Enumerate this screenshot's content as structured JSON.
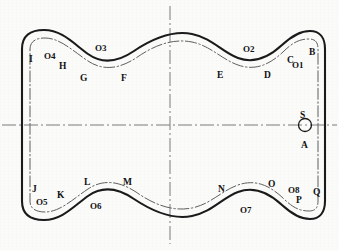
{
  "figure": {
    "origin_label": "(0,0)",
    "background_color": "#fbfbfa",
    "outline_color": "#1a1a1a",
    "offset_curve_color": "#6b6b6b",
    "centerline_color": "#7a7a7a"
  },
  "point_labels": [
    {
      "id": "I",
      "text": "I",
      "x": 29,
      "y": 55
    },
    {
      "id": "H",
      "text": "H",
      "x": 59,
      "y": 62
    },
    {
      "id": "G",
      "text": "G",
      "x": 80,
      "y": 74
    },
    {
      "id": "F",
      "text": "F",
      "x": 121,
      "y": 74
    },
    {
      "id": "E",
      "text": "E",
      "x": 217,
      "y": 71
    },
    {
      "id": "D",
      "text": "D",
      "x": 264,
      "y": 71
    },
    {
      "id": "C",
      "text": "C",
      "x": 287,
      "y": 56
    },
    {
      "id": "B",
      "text": "B",
      "x": 309,
      "y": 48
    },
    {
      "id": "S",
      "text": "S",
      "x": 300,
      "y": 111
    },
    {
      "id": "A",
      "text": "A",
      "x": 301,
      "y": 141
    },
    {
      "id": "Q",
      "text": "Q",
      "x": 313,
      "y": 188
    },
    {
      "id": "P",
      "text": "P",
      "x": 296,
      "y": 196
    },
    {
      "id": "O",
      "text": "O",
      "x": 268,
      "y": 180
    },
    {
      "id": "N",
      "text": "N",
      "x": 218,
      "y": 185
    },
    {
      "id": "M",
      "text": "M",
      "x": 123,
      "y": 178
    },
    {
      "id": "L",
      "text": "L",
      "x": 84,
      "y": 178
    },
    {
      "id": "K",
      "text": "K",
      "x": 57,
      "y": 191
    },
    {
      "id": "J",
      "text": "J",
      "x": 32,
      "y": 185
    }
  ],
  "arc_center_labels": [
    {
      "id": "O1",
      "text": "O1",
      "x": 292,
      "y": 61
    },
    {
      "id": "O2",
      "text": "O2",
      "x": 243,
      "y": 45
    },
    {
      "id": "O3",
      "text": "O3",
      "x": 95,
      "y": 44
    },
    {
      "id": "O4",
      "text": "O4",
      "x": 44,
      "y": 52
    },
    {
      "id": "O5",
      "text": "O5",
      "x": 36,
      "y": 198
    },
    {
      "id": "O6",
      "text": "O6",
      "x": 90,
      "y": 202
    },
    {
      "id": "O7",
      "text": "O7",
      "x": 240,
      "y": 206
    },
    {
      "id": "O8",
      "text": "O8",
      "x": 288,
      "y": 186
    }
  ],
  "origin": {
    "label": "(0,0)",
    "x": 190,
    "y": 143
  },
  "marker": {
    "name": "circle-marker-S-A",
    "shape": "circle",
    "cx": 305,
    "cy": 125,
    "r": 6.5
  },
  "centerlines": {
    "horizontal": {
      "y": 125,
      "x1": 2,
      "x2": 337,
      "style": "dash-dot"
    },
    "vertical": {
      "x": 170,
      "y1": 6,
      "y2": 244,
      "style": "dash-dot"
    }
  },
  "geometry": {
    "outline_path": "M 22 49 C 22 36, 30 30, 44 30 C 62 30, 74 44, 88 54 C 102 64, 118 62, 134 51 C 152 39, 172 30, 192 34 C 212 38, 222 52, 238 58 C 254 64, 268 58, 282 45 C 292 36, 300 31, 310 31 C 320 31, 325 38, 325 49 L 325 201 C 325 212, 320 219, 310 219 C 300 219, 292 214, 282 205 C 268 192, 254 186, 238 192 C 222 198, 212 212, 192 216 C 172 220, 152 211, 134 199 C 118 188, 102 186, 88 196 C 74 206, 62 220, 44 220 C 30 220, 22 214, 22 201 Z",
    "offset_path": "M 30 49 C 30 42, 35 38, 45 38 C 60 38, 73 51, 88 61 C 103 71, 119 69, 136 58 C 153 46, 172 38, 192 42 C 211 46, 221 59, 238 65 C 255 71, 269 65, 283 52 C 292 43, 299 39, 309 39 C 316 39, 318 43, 318 49 L 318 201 C 318 207, 316 211, 309 211 C 299 211, 292 207, 283 198 C 269 185, 255 179, 238 185 C 221 191, 211 204, 192 208 C 172 212, 153 204, 136 192 C 119 181, 103 179, 88 189 C 73 199, 60 212, 45 212 C 35 212, 30 208, 30 201 Z"
  }
}
